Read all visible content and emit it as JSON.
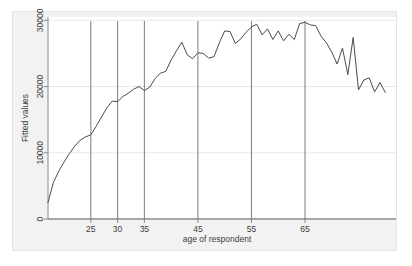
{
  "chart_data": {
    "type": "line",
    "title": "",
    "subtitle": "",
    "xlabel": "age of respondent",
    "ylabel": "Fitted values",
    "xlim": [
      17,
      82
    ],
    "ylim": [
      0,
      30500
    ],
    "grid": true,
    "gridlines_y": [
      10000,
      20000,
      30000
    ],
    "legend": "none",
    "xticks": [
      25,
      30,
      35,
      45,
      55,
      65
    ],
    "xtick_labels": [
      "25",
      "30",
      "35",
      "45",
      "55",
      "65"
    ],
    "yticks": [
      0,
      10000,
      20000,
      30000
    ],
    "ytick_labels": [
      "0",
      "10000",
      "20000",
      "30000"
    ],
    "vertical_reference_lines": [
      25,
      30,
      35,
      45,
      55,
      65
    ],
    "series": [
      {
        "name": "Fitted values",
        "color": "#4a4a4a",
        "x": [
          17,
          18,
          19,
          20,
          21,
          22,
          23,
          24,
          25,
          26,
          27,
          28,
          29,
          30,
          31,
          32,
          33,
          34,
          35,
          36,
          37,
          38,
          39,
          40,
          41,
          42,
          43,
          44,
          45,
          46,
          47,
          48,
          49,
          50,
          51,
          52,
          53,
          54,
          55,
          56,
          57,
          58,
          59,
          60,
          61,
          62,
          63,
          64,
          65,
          66,
          67,
          68,
          69,
          70,
          71,
          72,
          73,
          74,
          75,
          76,
          77,
          78,
          79,
          80
        ],
        "y": [
          2500,
          5500,
          7200,
          8600,
          9900,
          11000,
          11900,
          12400,
          12700,
          14000,
          15400,
          16800,
          17800,
          17700,
          18500,
          19000,
          19600,
          20000,
          19400,
          19900,
          21200,
          22000,
          22300,
          24000,
          25400,
          26700,
          24800,
          24200,
          25100,
          25000,
          24300,
          24500,
          26600,
          28400,
          28300,
          26500,
          27200,
          28200,
          29000,
          29400,
          27800,
          28700,
          27100,
          28400,
          26900,
          27900,
          27100,
          29500,
          29700,
          29300,
          29200,
          27600,
          26600,
          25200,
          23400,
          25800,
          21800,
          27400,
          19500,
          21000,
          21300,
          19200,
          20600,
          19100
        ],
        "y_tail_x": [
          65,
          66,
          67,
          68,
          69,
          70,
          71,
          72,
          73,
          74,
          75,
          76,
          77,
          78,
          79,
          80
        ],
        "note": "Single fitted-values line, peaks near age 55 at about 30000, declines thereafter with high-frequency oscillation"
      }
    ],
    "annotations": []
  },
  "axes": {
    "y_axis_title": "Fitted values",
    "x_axis_title": "age of respondent"
  },
  "colors": {
    "line": "#4a4a4a",
    "reference_line": "#6e6e6e",
    "gridline": "#e8e8e8",
    "axis": "#8a8a8a",
    "plot_background": "#ffffff",
    "figure_background": "#f2f2f2",
    "text": "#3d3d3d"
  }
}
